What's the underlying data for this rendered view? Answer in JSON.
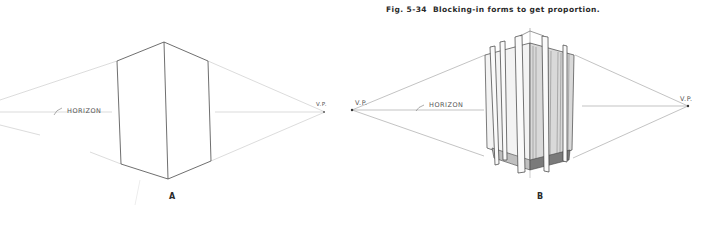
{
  "caption": {
    "figure_number": "Fig. 5-34",
    "text": "Blocking-in forms to get proportion."
  },
  "panels": [
    {
      "id": "A",
      "label": "A",
      "horizon_label": "HORIZON",
      "vp_right_label": "V.P."
    },
    {
      "id": "B",
      "label": "B",
      "horizon_label": "HORIZON",
      "vp_left_label": "V.P.",
      "vp_right_label": "V.P."
    }
  ],
  "colors": {
    "ink": "#3a3a3a",
    "construction_line": "#b8b8b8",
    "shading": "#6b6b6b"
  }
}
